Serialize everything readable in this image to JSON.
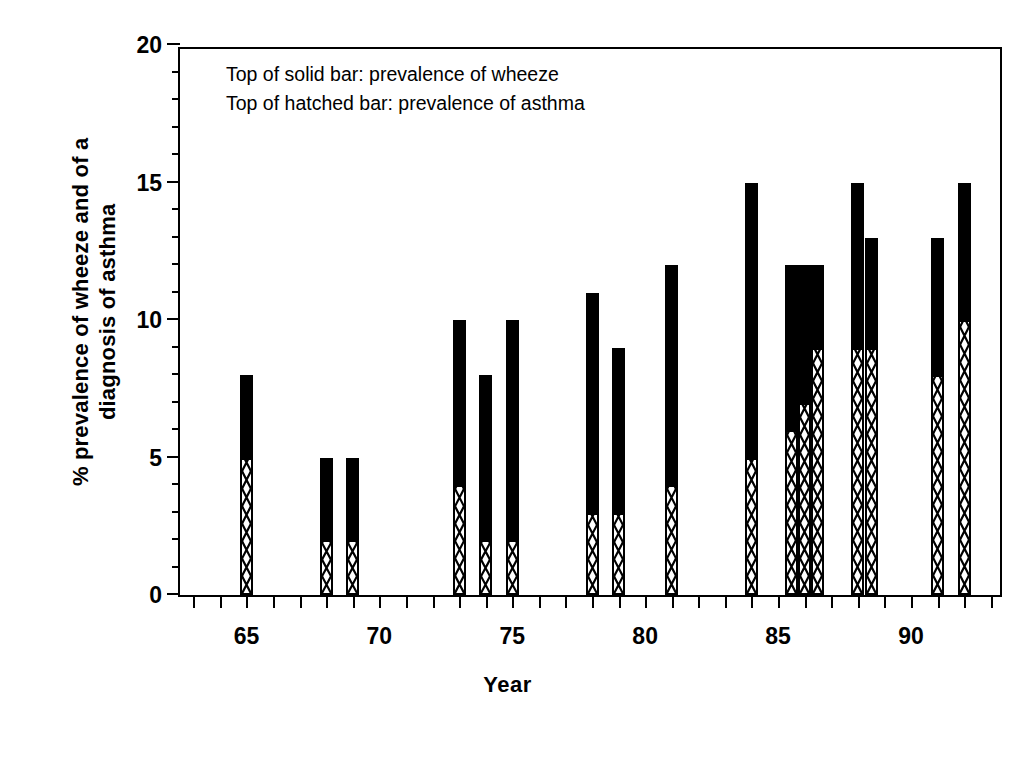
{
  "chart_data": {
    "type": "bar",
    "title": "",
    "xlabel": "Year",
    "ylabel_lines": [
      "% prevalence of wheeze and of a",
      "diagnosis of asthma"
    ],
    "ylabel": "% prevalence of wheeze and of a diagnosis of asthma",
    "xlim": [
      62.5,
      93.5
    ],
    "ylim": [
      0,
      20
    ],
    "y_major_ticks": [
      0,
      5,
      10,
      15,
      20
    ],
    "y_tick_labels": [
      "0",
      "5",
      "10",
      "15",
      "20"
    ],
    "y_minor_tick_interval": 1,
    "x_major_ticks": [
      65,
      70,
      75,
      80,
      85,
      90
    ],
    "x_tick_labels": [
      "65",
      "70",
      "75",
      "80",
      "85",
      "90"
    ],
    "x_minor_tick_interval": 1,
    "grid": false,
    "legend_position": "inside-top-left",
    "annotations": [
      "Top of solid bar: prevalence of wheeze",
      "Top of hatched bar: prevalence of asthma"
    ],
    "series": [
      {
        "name": "prevalence of wheeze",
        "style": "solid-bar-top"
      },
      {
        "name": "prevalence of asthma",
        "style": "hatched-bar-top"
      }
    ],
    "bars": [
      {
        "year": 65,
        "wheeze": 8,
        "asthma": 5
      },
      {
        "year": 68,
        "wheeze": 5,
        "asthma": 2
      },
      {
        "year": 69,
        "wheeze": 5,
        "asthma": 2
      },
      {
        "year": 73,
        "wheeze": 10,
        "asthma": 4
      },
      {
        "year": 74,
        "wheeze": 8,
        "asthma": 2
      },
      {
        "year": 75,
        "wheeze": 10,
        "asthma": 2
      },
      {
        "year": 78,
        "wheeze": 11,
        "asthma": 3
      },
      {
        "year": 79,
        "wheeze": 9,
        "asthma": 3
      },
      {
        "year": 81,
        "wheeze": 12,
        "asthma": 4
      },
      {
        "year": 84,
        "wheeze": 15,
        "asthma": 5
      },
      {
        "year": 85.5,
        "wheeze": 12,
        "asthma": 6
      },
      {
        "year": 86,
        "wheeze": 12,
        "asthma": 7
      },
      {
        "year": 86.5,
        "wheeze": 12,
        "asthma": 9
      },
      {
        "year": 88,
        "wheeze": 15,
        "asthma": 9
      },
      {
        "year": 88.5,
        "wheeze": 13,
        "asthma": 9
      },
      {
        "year": 91,
        "wheeze": 13,
        "asthma": 8
      },
      {
        "year": 92,
        "wheeze": 15,
        "asthma": 10
      }
    ],
    "colors": {
      "bar_solid": "#000000",
      "bar_hatch_fill": "#ffffff",
      "bar_hatch_stroke": "#000000",
      "axis": "#000000",
      "background": "#ffffff"
    }
  }
}
